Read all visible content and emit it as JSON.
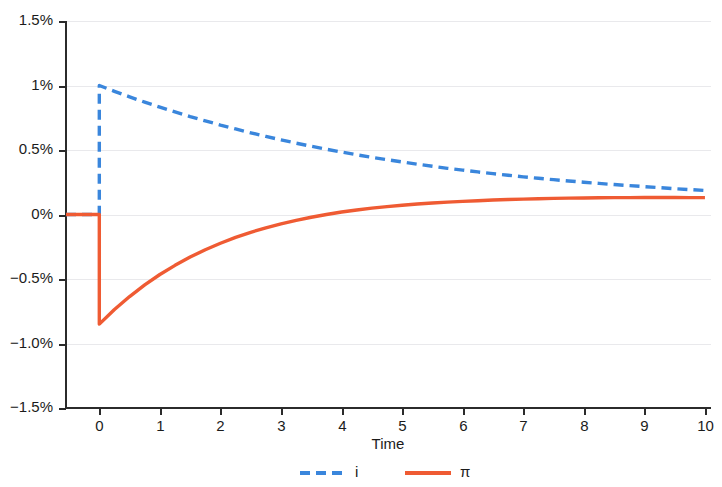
{
  "chart_data": {
    "type": "line",
    "title": "",
    "subtitle": "",
    "xlabel": "Time",
    "ylabel": "",
    "xlim": [
      -0.55,
      10.1
    ],
    "ylim": [
      -1.5,
      1.5
    ],
    "grid": true,
    "grid_axis": "y",
    "legend_position": "bottom-center",
    "x_ticks": [
      0,
      1,
      2,
      3,
      4,
      5,
      6,
      7,
      8,
      9,
      10
    ],
    "x_tick_labels": [
      "0",
      "1",
      "2",
      "3",
      "4",
      "5",
      "6",
      "7",
      "8",
      "9",
      "10"
    ],
    "y_ticks": [
      -1.5,
      -1.0,
      -0.5,
      0,
      0.5,
      1.0,
      1.5
    ],
    "y_tick_labels": [
      "−1.5%",
      "−1.0%",
      "−0.5%",
      "0%",
      "0.5%",
      "1%",
      "1.5%"
    ],
    "series": [
      {
        "name": "i",
        "legend_label": "i",
        "color": "#3a86dc",
        "style": "dashed",
        "width": 3.4,
        "x": [
          -0.55,
          0,
          0,
          0.25,
          0.5,
          0.75,
          1,
          1.25,
          1.5,
          1.75,
          2,
          2.25,
          2.5,
          2.75,
          3,
          3.25,
          3.5,
          3.75,
          4,
          4.25,
          4.5,
          4.75,
          5,
          5.25,
          5.5,
          5.75,
          6,
          6.25,
          6.5,
          6.75,
          7,
          7.25,
          7.5,
          7.75,
          8,
          8.25,
          8.5,
          8.75,
          9,
          9.25,
          9.5,
          9.75,
          10
        ],
        "y": [
          0,
          0,
          1.0,
          0.955,
          0.912,
          0.871,
          0.832,
          0.795,
          0.759,
          0.726,
          0.693,
          0.663,
          0.633,
          0.605,
          0.579,
          0.553,
          0.529,
          0.506,
          0.484,
          0.463,
          0.443,
          0.425,
          0.407,
          0.39,
          0.374,
          0.358,
          0.344,
          0.33,
          0.317,
          0.304,
          0.292,
          0.281,
          0.27,
          0.26,
          0.25,
          0.241,
          0.232,
          0.224,
          0.216,
          0.208,
          0.2,
          0.193,
          0.186
        ]
      },
      {
        "name": "pi",
        "legend_label": "π",
        "color": "#ef5b33",
        "style": "solid",
        "width": 3.4,
        "x": [
          -0.55,
          0,
          0,
          0.25,
          0.5,
          0.75,
          1,
          1.25,
          1.5,
          1.75,
          2,
          2.25,
          2.5,
          2.75,
          3,
          3.25,
          3.5,
          3.75,
          4,
          4.25,
          4.5,
          4.75,
          5,
          5.25,
          5.5,
          5.75,
          6,
          6.25,
          6.5,
          6.75,
          7,
          7.25,
          7.5,
          7.75,
          8,
          8.25,
          8.5,
          8.75,
          9,
          9.25,
          9.5,
          9.75,
          10
        ],
        "y": [
          0,
          0,
          -0.85,
          -0.737,
          -0.636,
          -0.546,
          -0.465,
          -0.394,
          -0.33,
          -0.273,
          -0.223,
          -0.178,
          -0.138,
          -0.103,
          -0.072,
          -0.045,
          -0.021,
          0.0,
          0.019,
          0.035,
          0.049,
          0.061,
          0.072,
          0.081,
          0.089,
          0.096,
          0.102,
          0.107,
          0.112,
          0.116,
          0.119,
          0.122,
          0.125,
          0.127,
          0.128,
          0.13,
          0.131,
          0.131,
          0.132,
          0.132,
          0.132,
          0.131,
          0.131
        ]
      }
    ],
    "annotations": [
      {
        "text": "impulse at t = 0: i jumps to 1%, π drops to −0.85%"
      }
    ]
  },
  "legend": {
    "items": [
      {
        "label": "i",
        "marker": "dashed-line",
        "color": "#3a86dc"
      },
      {
        "label": "π",
        "marker": "solid-line",
        "color": "#ef5b33"
      }
    ]
  },
  "axes": {
    "x_title": "Time"
  }
}
